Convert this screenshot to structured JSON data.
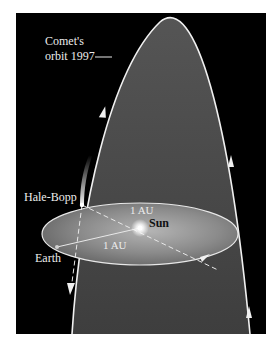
{
  "figure": {
    "labels": {
      "orbit_line1": "Comet's",
      "orbit_line2": "orbit 1997",
      "comet": "Hale-Bopp",
      "earth": "Earth",
      "sun": "Sun",
      "distance_upper": "1 AU",
      "distance_lower": "1 AU"
    },
    "colors": {
      "background": "#000000",
      "orbit_fill": "#4a4a4a",
      "orbit_stroke": "#f0f0f0",
      "earth_orbit_fill": "#8c8c8c",
      "sun_glow": "#ffffff",
      "margin": "#ffffff"
    }
  }
}
